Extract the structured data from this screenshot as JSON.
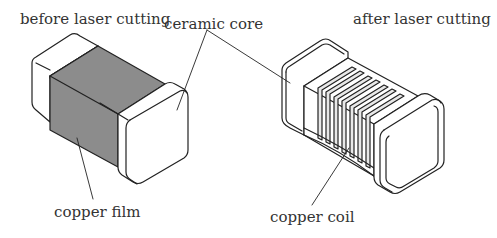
{
  "labels": {
    "before": "before laser cutting",
    "after": "after laser cutting",
    "ceramic_core": "ceramic core",
    "copper_film": "copper film",
    "copper_coil": "copper coil"
  },
  "colors": {
    "line": "#222222",
    "copper_film_fill": "#8c8c8c",
    "body_fill": "#ffffff",
    "coil_fill": "#e8e8e8"
  }
}
